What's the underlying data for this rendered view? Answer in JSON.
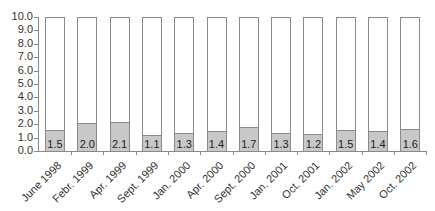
{
  "chart_data": {
    "type": "bar",
    "stacked": true,
    "title": "",
    "xlabel": "",
    "ylabel": "",
    "ylim": [
      0,
      10
    ],
    "yticks": [
      "0.0",
      "1.0",
      "2.0",
      "3.0",
      "4.0",
      "5.0",
      "6.0",
      "7.0",
      "8.0",
      "9.0",
      "10.0"
    ],
    "grid": false,
    "legend": null,
    "categories": [
      "June 1998",
      "Febr. 1999",
      "Apr. 1999",
      "Sept. 1999",
      "Jan. 2000",
      "Apr. 2000",
      "Sept. 2000",
      "Jan. 2001",
      "Oct. 2001",
      "Jan. 2002",
      "May 2002",
      "Oct. 2002"
    ],
    "series": [
      {
        "name": "value",
        "color": "#c8c8c8",
        "values": [
          1.5,
          2.0,
          2.1,
          1.1,
          1.3,
          1.4,
          1.7,
          1.3,
          1.2,
          1.5,
          1.4,
          1.6
        ]
      },
      {
        "name": "remainder",
        "color": "#ffffff",
        "values": [
          8.5,
          8.0,
          7.9,
          8.9,
          8.7,
          8.6,
          8.3,
          8.7,
          8.8,
          8.5,
          8.6,
          8.4
        ]
      }
    ],
    "data_labels": [
      "1.5",
      "2.0",
      "2.1",
      "1.1",
      "1.3",
      "1.4",
      "1.7",
      "1.3",
      "1.2",
      "1.5",
      "1.4",
      "1.6"
    ]
  }
}
